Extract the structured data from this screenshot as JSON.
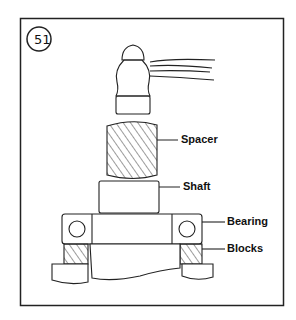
{
  "figure": {
    "number": "51",
    "labels": {
      "spacer": "Spacer",
      "shaft": "Shaft",
      "bearing": "Bearing",
      "blocks": "Blocks"
    }
  }
}
